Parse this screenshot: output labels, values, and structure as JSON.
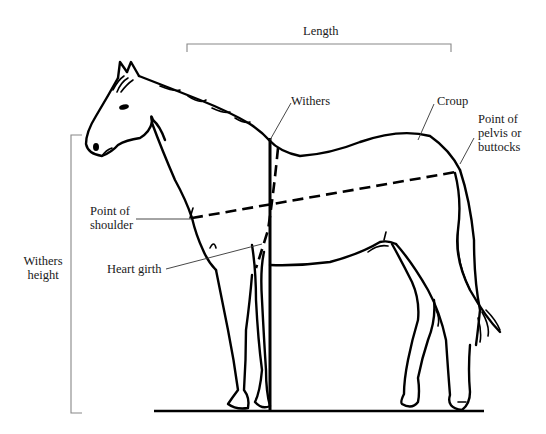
{
  "diagram": {
    "labels": {
      "length": "Length",
      "withers": "Withers",
      "croup": "Croup",
      "point_of_pelvis_line1": "Point of",
      "point_of_pelvis_line2": "pelvis or",
      "point_of_pelvis_line3": "buttocks",
      "point_of_shoulder_line1": "Point of",
      "point_of_shoulder_line2": "shoulder",
      "heart_girth": "Heart girth",
      "withers_height_line1": "Withers",
      "withers_height_line2": "height"
    },
    "measurements": [
      {
        "name": "Length",
        "type": "bracket-horizontal",
        "from": "Point of shoulder",
        "to": "Point of pelvis or buttocks"
      },
      {
        "name": "Withers height",
        "type": "bracket-vertical",
        "from": "ground",
        "to": "withers"
      },
      {
        "name": "Heart girth",
        "type": "dashed-circumference",
        "location": "behind withers around barrel"
      },
      {
        "name": "Body length line",
        "type": "dashed-line",
        "from": "Point of shoulder",
        "to": "Point of pelvis or buttocks"
      }
    ],
    "colors": {
      "line": "#000000",
      "bracket": "#888888",
      "background": "#ffffff"
    }
  }
}
